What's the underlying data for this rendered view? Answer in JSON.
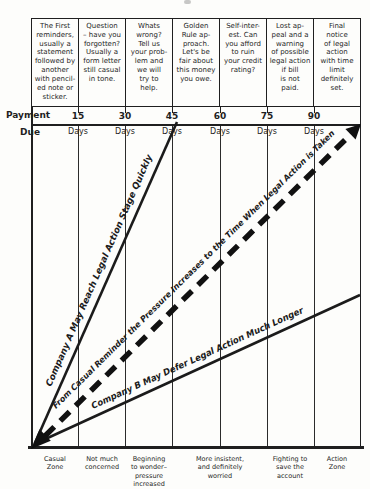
{
  "reminder_table": {
    "cells": [
      "The First\nreminders,\nusually a\nstatement\nfollowed by\nanother\nwith pencil-\ned note or\nsticker.",
      "Question\n– have you\nforgotten?\nUsually a\nform letter\nstill casual\nin tone.",
      "Whats\nwrong?\nTell us\nyour prob-\nlem and\nwe will\ntry to\nhelp.",
      "Golden\nRule ap-\nproach.\nLet's be\nfair about\nthis money\nyou owe.",
      "Self-inter-\nest. Can\nyou afford\nto ruin\nyour credit\nrating?",
      "Lost ap-\npeal and a\nwarning\nof possible\nlegal action\nif bill\nis not\npaid.",
      "Final\nnotice\nof legal\naction\nwith time\nlimit\ndefinitely\nset."
    ]
  },
  "axis": {
    "payment": "Payment",
    "due": "Due",
    "day_values": [
      "15",
      "30",
      "45",
      "60",
      "75",
      "90"
    ],
    "day_unit": "Days"
  },
  "line_labels": {
    "company_a": "Company A May Reach Legal Action Stage Quickly",
    "pressure": "From Casual Reminder the Pressure Increases to the Time When Legal Action is Taken",
    "company_b": "Company B May Defer Legal Action Much Longer"
  },
  "zones": [
    "Casual\nZone",
    "Not much\nconcerned",
    "Beginning\nto wonder–\npressure\nincreased",
    "More insistent,\nand definitely\nworried",
    "Fighting to\nsave the\naccount",
    "Action\nZone"
  ],
  "colors": {
    "ink": "#1f1f1f",
    "paper": "#fdfdfb"
  }
}
